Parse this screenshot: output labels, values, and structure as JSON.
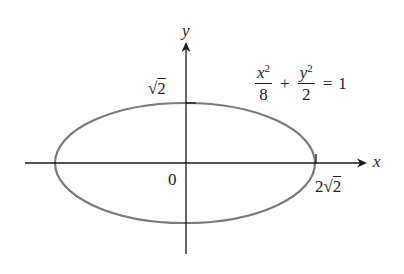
{
  "diagram": {
    "type": "ellipse-graph",
    "axes": {
      "x_label": "x",
      "y_label": "y",
      "origin_label": "0"
    },
    "ellipse": {
      "equation": {
        "term1_num_var": "x",
        "term1_num_exp": "2",
        "term1_den": "8",
        "plus": "+",
        "term2_num_var": "y",
        "term2_num_exp": "2",
        "term2_den": "2",
        "equals": "=",
        "rhs": "1"
      },
      "semi_major_label_coef": "2",
      "semi_major_label_radical": "√",
      "semi_major_label_radicand": "2",
      "semi_minor_label_radical": "√",
      "semi_minor_label_radicand": "2",
      "stroke_color": "#7a7a7a"
    },
    "axis_color": "#1a1a1a"
  }
}
